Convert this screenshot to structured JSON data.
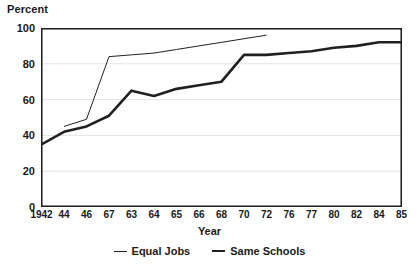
{
  "chart_data": {
    "type": "line",
    "title": "",
    "ylabel": "Percent",
    "xlabel": "Year",
    "ylim": [
      0,
      100
    ],
    "yticks": [
      0,
      20,
      40,
      60,
      80,
      100
    ],
    "grid": "horizontal",
    "legend_position": "bottom-center",
    "categories": [
      "1942",
      "44",
      "46",
      "67",
      "63",
      "64",
      "65",
      "66",
      "68",
      "70",
      "72",
      "76",
      "77",
      "80",
      "82",
      "84",
      "85"
    ],
    "series": [
      {
        "name": "Equal Jobs",
        "style": "thin-line",
        "color": "#231f20",
        "values": [
          null,
          45,
          49,
          84,
          85,
          86,
          88,
          90,
          92,
          94,
          96,
          null,
          null,
          null,
          null,
          null,
          null
        ]
      },
      {
        "name": "Same Schools",
        "style": "thick-line",
        "color": "#231f20",
        "values": [
          35,
          42,
          45,
          51,
          65,
          62,
          66,
          68,
          70,
          85,
          85,
          86,
          87,
          89,
          90,
          92,
          92
        ]
      }
    ]
  },
  "legend": {
    "items": [
      {
        "label": "Equal Jobs",
        "swatch": "thin-line-swatch"
      },
      {
        "label": "Same Schools",
        "swatch": "thick-line-swatch"
      }
    ]
  },
  "axes": {
    "frame_color": "#231f20",
    "gridline_color": "#e3e3e3"
  }
}
